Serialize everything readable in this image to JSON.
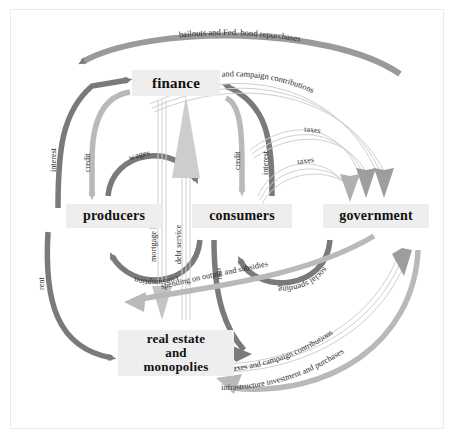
{
  "diagram": {
    "background": "#ffffff",
    "frame_border": "#ebebeb",
    "colors": {
      "dark_arrow": "#7a7a7a",
      "light_arrow": "#b9b9b9",
      "node_fill": "#eeeeee",
      "node_text": "#111111",
      "label_text": "#2a2a2a"
    },
    "nodes": [
      {
        "id": "finance",
        "label": "finance",
        "x": 132,
        "y": 70,
        "w": 88,
        "h": 26,
        "font": 15
      },
      {
        "id": "producers",
        "label": "producers",
        "x": 66,
        "y": 204,
        "w": 96,
        "h": 24,
        "font": 14
      },
      {
        "id": "consumers",
        "label": "consumers",
        "x": 192,
        "y": 204,
        "w": 100,
        "h": 24,
        "font": 14
      },
      {
        "id": "government",
        "label": "government",
        "x": 323,
        "y": 204,
        "w": 106,
        "h": 24,
        "font": 14
      },
      {
        "id": "real-estate",
        "label": "real estate\nand\nmonopolies",
        "x": 118,
        "y": 330,
        "w": 116,
        "h": 44,
        "font": 13
      }
    ],
    "flows": [
      {
        "id": "bailouts",
        "label": "bailouts and Fed. bond repurchases",
        "from": "government",
        "to": "finance",
        "style": "dark-solid"
      },
      {
        "id": "bond-purchases",
        "label": "bond purchases and campaign contributions",
        "from": "finance",
        "to": "government",
        "style": "light-striped"
      },
      {
        "id": "interest-left",
        "label": "interest",
        "from": "producers",
        "to": "finance",
        "style": "dark-solid"
      },
      {
        "id": "credit-left",
        "label": "credit",
        "from": "finance",
        "to": "producers",
        "style": "light-solid"
      },
      {
        "id": "wages",
        "label": "wages",
        "from": "producers",
        "to": "consumers",
        "style": "dark-solid"
      },
      {
        "id": "consumption",
        "label": "consumption",
        "from": "consumers",
        "to": "producers",
        "style": "dark-solid"
      },
      {
        "id": "mortgage",
        "label": "mortgage lending",
        "from": "finance",
        "to": "real-estate",
        "style": "light-striped"
      },
      {
        "id": "debt-service",
        "label": "debt service",
        "from": "real-estate",
        "to": "finance",
        "style": "light-striped"
      },
      {
        "id": "credit-right",
        "label": "credit",
        "from": "finance",
        "to": "consumers",
        "style": "light-solid"
      },
      {
        "id": "interest-right",
        "label": "interest",
        "from": "consumers",
        "to": "finance",
        "style": "dark-solid"
      },
      {
        "id": "taxes-upper",
        "label": "taxes",
        "from": "consumers",
        "to": "government",
        "style": "light-striped"
      },
      {
        "id": "taxes-lower",
        "label": "taxes",
        "from": "consumers",
        "to": "government",
        "style": "light-striped"
      },
      {
        "id": "social-spending",
        "label": "social spending",
        "from": "government",
        "to": "consumers",
        "style": "dark-solid"
      },
      {
        "id": "rent-left",
        "label": "rent",
        "from": "real-estate",
        "to": "producers",
        "style": "dark-solid"
      },
      {
        "id": "rent-center",
        "label": "rent",
        "from": "consumers",
        "to": "real-estate",
        "style": "dark-solid"
      },
      {
        "id": "spending-output",
        "label": "spending on output and subsidies",
        "from": "government",
        "to": "producers",
        "style": "light-solid"
      },
      {
        "id": "taxes-campaign",
        "label": "taxes and campaign contributions",
        "from": "real-estate",
        "to": "government",
        "style": "light-striped"
      },
      {
        "id": "infrastructure",
        "label": "infrastructure investment and purchases",
        "from": "government",
        "to": "real-estate",
        "style": "light-solid"
      }
    ]
  }
}
